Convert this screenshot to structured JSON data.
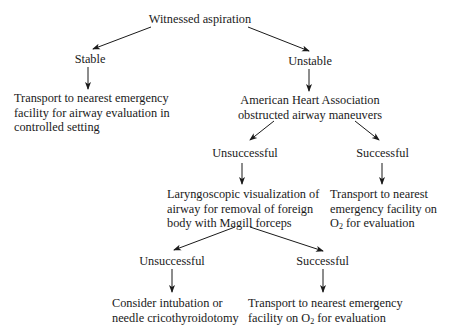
{
  "diagram": {
    "type": "flowchart",
    "nodes": {
      "root": {
        "lines": [
          "Witnessed aspiration"
        ]
      },
      "stable": {
        "lines": [
          "Stable"
        ]
      },
      "unstable": {
        "lines": [
          "Unstable"
        ]
      },
      "stable_action": {
        "lines": [
          "Transport to nearest emergency",
          "facility for airway evaluation in",
          "controlled setting"
        ]
      },
      "aha": {
        "lines": [
          "American Heart Association",
          "obstructed airway maneuvers"
        ]
      },
      "aha_unsuccessful": {
        "lines": [
          "Unsuccessful"
        ]
      },
      "aha_successful": {
        "lines": [
          "Successful"
        ]
      },
      "laryngoscopic": {
        "lines": [
          "Laryngoscopic visualization of",
          "airway for removal of foreign",
          "body with Magill forceps"
        ]
      },
      "aha_success_action": {
        "lines": [
          "Transport to nearest",
          "emergency facility on"
        ],
        "o2_line": {
          "prefix": "O",
          "sub": "2",
          "suffix": " for evaluation"
        }
      },
      "magill_unsuccessful": {
        "lines": [
          "Unsuccessful"
        ]
      },
      "magill_successful": {
        "lines": [
          "Successful"
        ]
      },
      "magill_fail_action": {
        "lines": [
          "Consider intubation or",
          "needle cricothyroidotomy"
        ]
      },
      "magill_success_action": {
        "lines": [
          "Transport to nearest emergency"
        ],
        "o2_line": {
          "prefix": "facility on O",
          "sub": "2",
          "suffix": " for evaluation"
        }
      }
    },
    "edges": [
      [
        "root",
        "stable"
      ],
      [
        "root",
        "unstable"
      ],
      [
        "stable",
        "stable_action"
      ],
      [
        "unstable",
        "aha"
      ],
      [
        "aha",
        "aha_unsuccessful"
      ],
      [
        "aha",
        "aha_successful"
      ],
      [
        "aha_unsuccessful",
        "laryngoscopic"
      ],
      [
        "aha_successful",
        "aha_success_action"
      ],
      [
        "laryngoscopic",
        "magill_unsuccessful"
      ],
      [
        "laryngoscopic",
        "magill_successful"
      ],
      [
        "magill_unsuccessful",
        "magill_fail_action"
      ],
      [
        "magill_successful",
        "magill_success_action"
      ]
    ]
  }
}
